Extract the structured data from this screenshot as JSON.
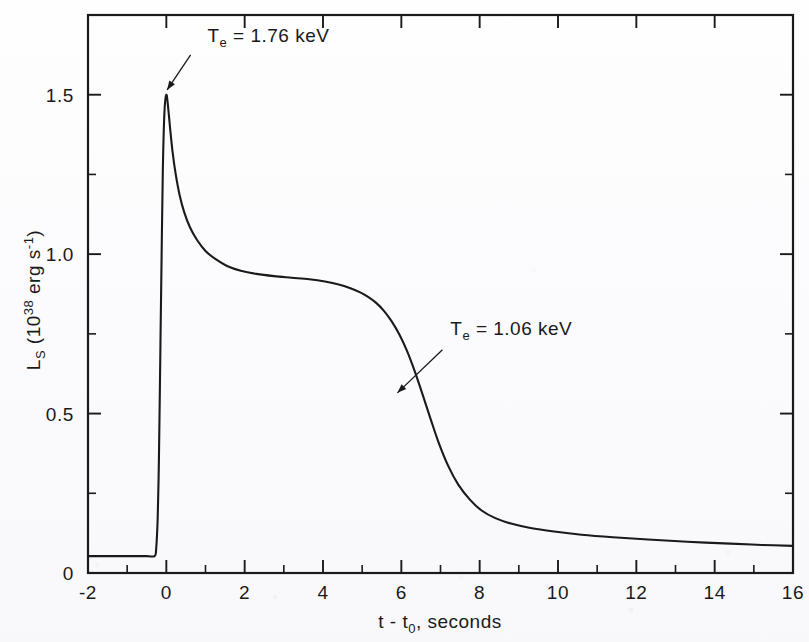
{
  "chart_data": {
    "type": "line",
    "title": "",
    "xlabel": "t - t0, seconds",
    "xlabel_parts": {
      "pre": "t - t",
      "sub": "0",
      "post": ", seconds"
    },
    "ylabel": "LS (1038 erg s-1)",
    "ylabel_parts": {
      "main": "L",
      "main_sub": "S",
      "open": " (10",
      "exp": "38",
      "mid": " erg s",
      "exp2": "-1",
      "close": ")"
    },
    "xlim": [
      -2,
      16
    ],
    "ylim": [
      0,
      1.75
    ],
    "x_ticks_major": [
      -2,
      0,
      2,
      4,
      6,
      8,
      10,
      12,
      14,
      16
    ],
    "x_tick_labels": [
      "-2",
      "0",
      "2",
      "4",
      "6",
      "8",
      "10",
      "12",
      "14",
      "16"
    ],
    "x_ticks_minor": [
      -1,
      1,
      3,
      5,
      7,
      9,
      11,
      13,
      15
    ],
    "y_ticks_major": [
      0,
      0.5,
      1.0,
      1.5
    ],
    "y_tick_labels": [
      "0",
      "0.5",
      "1.0",
      "1.5"
    ],
    "y_ticks_minor": [
      0.25,
      0.75,
      1.25
    ],
    "grid": false,
    "legend": "none",
    "line_color": "#1a1a1a",
    "series": [
      {
        "name": "LS",
        "x": [
          -2.0,
          -1.0,
          -0.5,
          -0.3,
          -0.26,
          -0.22,
          -0.19,
          -0.17,
          -0.15,
          -0.12,
          -0.09,
          -0.05,
          0.0,
          0.05,
          0.1,
          0.16,
          0.24,
          0.34,
          0.46,
          0.6,
          0.78,
          1.0,
          1.25,
          1.55,
          1.9,
          2.3,
          2.75,
          3.2,
          3.65,
          4.05,
          4.4,
          4.7,
          4.95,
          5.15,
          5.35,
          5.55,
          5.75,
          5.95,
          6.15,
          6.35,
          6.55,
          6.75,
          6.95,
          7.2,
          7.45,
          7.75,
          8.05,
          8.4,
          8.8,
          9.3,
          9.9,
          10.6,
          11.4,
          12.3,
          13.3,
          14.4,
          15.2,
          16.0
        ],
        "y": [
          0.053,
          0.053,
          0.053,
          0.053,
          0.075,
          0.175,
          0.35,
          0.53,
          0.72,
          1.0,
          1.26,
          1.44,
          1.5,
          1.455,
          1.39,
          1.32,
          1.25,
          1.185,
          1.13,
          1.085,
          1.045,
          1.01,
          0.985,
          0.963,
          0.948,
          0.938,
          0.931,
          0.926,
          0.921,
          0.914,
          0.905,
          0.893,
          0.88,
          0.866,
          0.848,
          0.823,
          0.79,
          0.748,
          0.695,
          0.63,
          0.557,
          0.482,
          0.41,
          0.335,
          0.278,
          0.23,
          0.196,
          0.172,
          0.155,
          0.141,
          0.13,
          0.12,
          0.112,
          0.105,
          0.098,
          0.092,
          0.088,
          0.085
        ]
      }
    ],
    "annotations": [
      {
        "id": "peak-temperature",
        "text": "Te = 1.76 keV",
        "text_parts": {
          "pre": "T",
          "sub": "e",
          "post": " = 1.76 keV"
        },
        "label_x": 1.05,
        "label_y": 1.665,
        "arrow_from_x": 0.62,
        "arrow_from_y": 1.625,
        "arrow_to_x": 0.02,
        "arrow_to_y": 1.515
      },
      {
        "id": "late-temperature",
        "text": "Te = 1.06 keV",
        "text_parts": {
          "pre": "T",
          "sub": "e",
          "post": " = 1.06 keV"
        },
        "label_x": 7.25,
        "label_y": 0.745,
        "arrow_from_x": 7.05,
        "arrow_from_y": 0.7,
        "arrow_to_x": 5.9,
        "arrow_to_y": 0.565
      }
    ]
  }
}
